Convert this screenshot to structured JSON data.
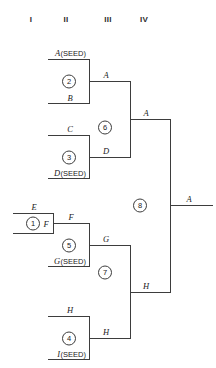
{
  "figure": {
    "kind": "single-elimination-tournament-bracket",
    "title": "",
    "seed_tag": "(SEED)"
  },
  "rounds": [
    {
      "id": "round-1",
      "label": "I"
    },
    {
      "id": "round-2",
      "label": "II"
    },
    {
      "id": "round-3",
      "label": "III"
    },
    {
      "id": "round-4",
      "label": "IV"
    }
  ],
  "matches": [
    {
      "number": "1",
      "round": "I",
      "top_entry": "E",
      "bottom_entry": "F",
      "winner": "F",
      "top_is_seed": false,
      "bottom_is_seed": false
    },
    {
      "number": "2",
      "round": "II",
      "top_entry": "A",
      "bottom_entry": "B",
      "winner": "A",
      "top_is_seed": true,
      "bottom_is_seed": false
    },
    {
      "number": "3",
      "round": "II",
      "top_entry": "C",
      "bottom_entry": "D",
      "winner": "D",
      "top_is_seed": false,
      "bottom_is_seed": true
    },
    {
      "number": "5",
      "round": "II",
      "top_entry": "F",
      "bottom_entry": "G",
      "winner": "G",
      "top_is_seed": false,
      "bottom_is_seed": true
    },
    {
      "number": "4",
      "round": "II",
      "top_entry": "H",
      "bottom_entry": "I",
      "winner": "H",
      "top_is_seed": false,
      "bottom_is_seed": true
    },
    {
      "number": "6",
      "round": "III",
      "top_entry": "A",
      "bottom_entry": "D",
      "winner": "A",
      "top_is_seed": false,
      "bottom_is_seed": false
    },
    {
      "number": "7",
      "round": "III",
      "top_entry": "G",
      "bottom_entry": "H",
      "winner": "H",
      "top_is_seed": false,
      "bottom_is_seed": false
    },
    {
      "number": "8",
      "round": "IV",
      "top_entry": "A",
      "bottom_entry": "H",
      "winner": "A",
      "top_is_seed": false,
      "bottom_is_seed": false
    }
  ],
  "labels": {
    "m1_top": "E",
    "m1_bottom": "F",
    "m1_winner": "F",
    "m2_top_name": "A",
    "m2_top_seed": "(SEED)",
    "m2_bottom": "B",
    "m2_winner": "A",
    "m3_top": "C",
    "m3_bottom_name": "D",
    "m3_bottom_seed": "(SEED)",
    "m3_winner": "D",
    "m5_top": "F",
    "m5_bottom_name": "G",
    "m5_bottom_seed": "(SEED)",
    "m5_winner": "G",
    "m4_top": "H",
    "m4_bottom_name": "I",
    "m4_bottom_seed": "(SEED)",
    "m4_winner": "H",
    "m6_winner": "A",
    "m7_winner": "H",
    "m8_winner": "A",
    "n1": "1",
    "n2": "2",
    "n3": "3",
    "n4": "4",
    "n5": "5",
    "n6": "6",
    "n7": "7",
    "n8": "8",
    "r1": "I",
    "r2": "II",
    "r3": "III",
    "r4": "IV"
  },
  "colors": {
    "line": "#3d3d3d",
    "text": "#1a1a1a",
    "background": "#ffffff"
  }
}
